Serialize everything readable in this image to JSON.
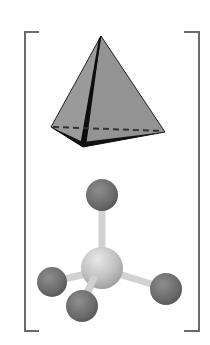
{
  "figure": {
    "colors": {
      "background": "#ffffff",
      "bracket": "#6a6a6a",
      "face_light": "#9a9a9a",
      "face_mid": "#8c8c8c",
      "edge_dark": "#111111",
      "outer_atom": "#6e6e6e",
      "central_atom": "#c4c4c4",
      "bond": "#d6d6d6"
    },
    "bracket": {
      "left_x": 25,
      "right_x": 199,
      "top_y": 32,
      "bottom_y": 331,
      "serif_length": 14
    },
    "tetrahedron": {
      "apex": [
        101,
        36
      ],
      "left": [
        51,
        127
      ],
      "right": [
        165,
        132
      ],
      "front": [
        83,
        147
      ]
    },
    "molecule": {
      "central_atom": {
        "cx": 102,
        "cy": 268,
        "r": 21
      },
      "outer_atoms": [
        {
          "name": "top",
          "cx": 102,
          "cy": 195,
          "r": 16
        },
        {
          "name": "left",
          "cx": 52,
          "cy": 282,
          "r": 15
        },
        {
          "name": "front",
          "cx": 82,
          "cy": 306,
          "r": 16
        },
        {
          "name": "right",
          "cx": 166,
          "cy": 289,
          "r": 16
        }
      ]
    }
  }
}
